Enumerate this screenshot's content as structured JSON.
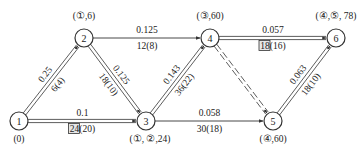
{
  "nodes": [
    {
      "id": "1",
      "label": "1",
      "x": 19,
      "y": 121,
      "annotation": "(0)",
      "ax": 19,
      "ay": 142
    },
    {
      "id": "2",
      "label": "2",
      "x": 84,
      "y": 38,
      "annotation": "(①,6)",
      "ax": 84,
      "ay": 19
    },
    {
      "id": "3",
      "label": "3",
      "x": 146,
      "y": 121,
      "annotation": "(①, ②,24)",
      "ax": 150,
      "ay": 142
    },
    {
      "id": "4",
      "label": "4",
      "x": 210,
      "y": 38,
      "annotation": "(③,60)",
      "ax": 210,
      "ay": 19
    },
    {
      "id": "5",
      "label": "5",
      "x": 273,
      "y": 121,
      "annotation": "(④,60)",
      "ax": 273,
      "ay": 142
    },
    {
      "id": "6",
      "label": "6",
      "x": 336,
      "y": 38,
      "annotation": "(④,⑤, 78)",
      "ax": 336,
      "ay": 19
    }
  ],
  "edges": [
    {
      "from": "1",
      "to": "2",
      "top": "0.25",
      "bottom": "6(4)",
      "style": "double",
      "boxed": false
    },
    {
      "from": "1",
      "to": "3",
      "top": "0.1",
      "bottom": "24(20)",
      "boxedPart": "24",
      "restPart": "(20)",
      "style": "double",
      "boxed": true
    },
    {
      "from": "2",
      "to": "4",
      "top": "0.125",
      "bottom": "12(8)",
      "style": "single",
      "boxed": false
    },
    {
      "from": "2",
      "to": "3",
      "top": "0.125",
      "bottom": "18(10)",
      "style": "double",
      "boxed": false
    },
    {
      "from": "3",
      "to": "4",
      "top": "0.143",
      "bottom": "36(22)",
      "style": "double",
      "boxed": false
    },
    {
      "from": "3",
      "to": "5",
      "top": "0.058",
      "bottom": "30(18)",
      "style": "single",
      "boxed": false
    },
    {
      "from": "4",
      "to": "6",
      "top": "0.057",
      "bottom": "18(16)",
      "boxedPart": "18",
      "restPart": "(16)",
      "style": "double",
      "boxed": true
    },
    {
      "from": "4",
      "to": "5",
      "top": "",
      "bottom": "",
      "style": "dashed-double",
      "boxed": false
    },
    {
      "from": "5",
      "to": "6",
      "top": "0.063",
      "bottom": "18(10)",
      "style": "double",
      "boxed": false
    }
  ],
  "colors": {
    "line": "#333333",
    "text": "#222222",
    "box_fill": "#e6e6e6"
  }
}
